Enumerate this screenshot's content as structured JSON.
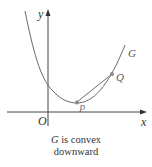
{
  "figure": {
    "labels": {
      "y_axis": "y",
      "x_axis": "x",
      "origin": "O",
      "curve": "G",
      "point_p": "P",
      "point_q": "Q"
    },
    "caption": {
      "curve_name": "G",
      "line1_rest": " is convex",
      "line2": "downward"
    },
    "colors": {
      "axis": "#444444",
      "curve": "#6a6a6a",
      "chord": "#6a6a6a",
      "points": "#888888"
    }
  }
}
